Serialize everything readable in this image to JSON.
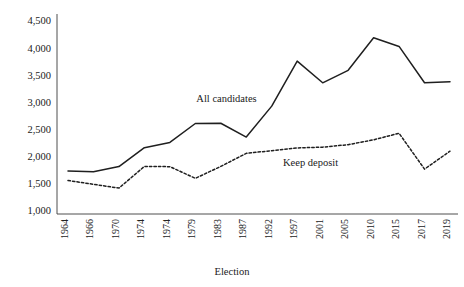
{
  "chart_data": {
    "type": "line",
    "title": "",
    "xlabel": "Election",
    "ylabel": "",
    "grid": false,
    "legend_position": "inline-annotation",
    "categories": [
      "1964",
      "1966",
      "1970",
      "1974",
      "1974",
      "1979",
      "1983",
      "1987",
      "1992",
      "1997",
      "2001",
      "2005",
      "2010",
      "2015",
      "2017",
      "2019"
    ],
    "ylim": [
      1000,
      4500
    ],
    "yticks": [
      1000,
      1500,
      2000,
      2500,
      3000,
      3500,
      4000,
      4500
    ],
    "ytick_labels": [
      "1,000",
      "1,500",
      "2,000",
      "2,500",
      "3,000",
      "3,500",
      "4,000",
      "4,500"
    ],
    "series": [
      {
        "name": "All candidates",
        "style": "solid",
        "color": "#1f1f1f",
        "values": [
          1757,
          1740,
          1837,
          2185,
          2282,
          2630,
          2635,
          2380,
          2950,
          3780,
          3380,
          3610,
          4210,
          4050,
          3380,
          3400
        ]
      },
      {
        "name": "Keep deposit",
        "style": "dashed",
        "color": "#1f1f1f",
        "values": [
          1580,
          1510,
          1440,
          1840,
          1835,
          1620,
          1840,
          2080,
          2130,
          2180,
          2195,
          2240,
          2330,
          2450,
          1790,
          2120
        ]
      }
    ],
    "annotations": [
      {
        "text": "All candidates",
        "x_frac": 0.415,
        "y_value": 3020
      },
      {
        "text": "Keep deposit",
        "x_frac": 0.635,
        "y_value": 1840
      }
    ]
  }
}
